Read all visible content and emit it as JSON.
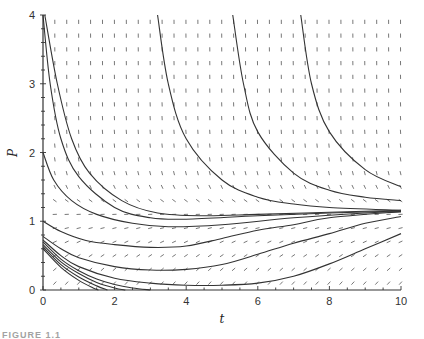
{
  "chart_data": {
    "type": "line",
    "subtype": "direction-field-with-solution-curves",
    "title": "",
    "xlabel": "t",
    "ylabel": "P",
    "xlim": [
      0,
      10
    ],
    "ylim": [
      0,
      4
    ],
    "x_ticks": [
      0,
      2,
      4,
      6,
      8,
      10
    ],
    "y_ticks": [
      0,
      1,
      2,
      3,
      4
    ],
    "x_tick_labels": [
      "0",
      "2",
      "4",
      "6",
      "8",
      "10"
    ],
    "y_tick_labels": [
      "0",
      "1",
      "2",
      "3",
      "4"
    ],
    "grid": false,
    "legend": null,
    "equilibrium_approx": 1.15,
    "slope_field": {
      "t_spacing": 0.333,
      "p_spacing": 0.2,
      "description": "short dash segments; steep negative slopes above P≈1.5, nearly flat near P≈1.15, positive small slopes below"
    },
    "series": [
      {
        "name": "curve-1",
        "points": [
          [
            0.0,
            4.0
          ],
          [
            0.2,
            3.0
          ],
          [
            0.5,
            2.2
          ],
          [
            1.0,
            1.65
          ],
          [
            2.0,
            1.2
          ],
          [
            3.0,
            1.05
          ],
          [
            4.0,
            1.03
          ],
          [
            6.0,
            1.08
          ],
          [
            8.0,
            1.12
          ],
          [
            10.0,
            1.15
          ]
        ]
      },
      {
        "name": "curve-2",
        "points": [
          [
            0.05,
            4.0
          ],
          [
            0.4,
            3.0
          ],
          [
            0.8,
            2.2
          ],
          [
            1.3,
            1.7
          ],
          [
            2.2,
            1.3
          ],
          [
            3.2,
            1.12
          ],
          [
            4.5,
            1.08
          ],
          [
            6.0,
            1.1
          ],
          [
            8.0,
            1.13
          ],
          [
            10.0,
            1.16
          ]
        ]
      },
      {
        "name": "curve-3",
        "points": [
          [
            0.0,
            2.0
          ],
          [
            0.3,
            1.6
          ],
          [
            0.8,
            1.3
          ],
          [
            1.5,
            1.1
          ],
          [
            2.5,
            0.97
          ],
          [
            3.5,
            0.92
          ],
          [
            5.0,
            0.95
          ],
          [
            7.0,
            1.05
          ],
          [
            9.0,
            1.12
          ],
          [
            10.0,
            1.14
          ]
        ]
      },
      {
        "name": "curve-4",
        "points": [
          [
            0.0,
            1.0
          ],
          [
            0.5,
            0.85
          ],
          [
            1.2,
            0.72
          ],
          [
            2.0,
            0.66
          ],
          [
            3.0,
            0.62
          ],
          [
            4.0,
            0.64
          ],
          [
            5.0,
            0.75
          ],
          [
            6.0,
            0.87
          ],
          [
            7.0,
            0.95
          ],
          [
            8.0,
            1.05
          ],
          [
            10.0,
            1.14
          ]
        ]
      },
      {
        "name": "curve-5",
        "points": [
          [
            0.0,
            0.78
          ],
          [
            0.5,
            0.6
          ],
          [
            1.0,
            0.47
          ],
          [
            2.0,
            0.34
          ],
          [
            3.0,
            0.29
          ],
          [
            4.0,
            0.3
          ],
          [
            5.0,
            0.37
          ],
          [
            6.0,
            0.52
          ],
          [
            7.0,
            0.68
          ],
          [
            8.0,
            0.82
          ],
          [
            9.0,
            0.97
          ],
          [
            10.0,
            1.07
          ]
        ]
      },
      {
        "name": "curve-6",
        "points": [
          [
            0.0,
            0.73
          ],
          [
            0.5,
            0.5
          ],
          [
            1.0,
            0.34
          ],
          [
            2.0,
            0.17
          ],
          [
            3.0,
            0.1
          ],
          [
            4.0,
            0.07
          ],
          [
            5.0,
            0.07
          ],
          [
            6.0,
            0.1
          ],
          [
            7.0,
            0.2
          ],
          [
            8.0,
            0.38
          ],
          [
            9.0,
            0.6
          ],
          [
            10.0,
            0.82
          ]
        ]
      },
      {
        "name": "curve-7",
        "points": [
          [
            0.0,
            0.7
          ],
          [
            0.5,
            0.45
          ],
          [
            1.0,
            0.28
          ],
          [
            1.5,
            0.16
          ],
          [
            2.0,
            0.08
          ],
          [
            2.5,
            0.03
          ],
          [
            3.0,
            0.0
          ]
        ]
      },
      {
        "name": "curve-8",
        "points": [
          [
            0.0,
            0.66
          ],
          [
            0.5,
            0.41
          ],
          [
            1.0,
            0.24
          ],
          [
            1.5,
            0.11
          ],
          [
            2.0,
            0.03
          ],
          [
            2.3,
            0.0
          ]
        ]
      },
      {
        "name": "curve-9",
        "points": [
          [
            0.0,
            0.63
          ],
          [
            0.5,
            0.37
          ],
          [
            1.0,
            0.19
          ],
          [
            1.5,
            0.06
          ],
          [
            1.8,
            0.0
          ]
        ]
      },
      {
        "name": "curve-10",
        "points": [
          [
            0.0,
            0.6
          ],
          [
            0.5,
            0.33
          ],
          [
            1.0,
            0.14
          ],
          [
            1.4,
            0.03
          ],
          [
            1.55,
            0.0
          ]
        ]
      },
      {
        "name": "curve-11",
        "points": [
          [
            3.2,
            4.0
          ],
          [
            3.5,
            3.0
          ],
          [
            4.0,
            2.2
          ],
          [
            5.0,
            1.6
          ],
          [
            6.0,
            1.35
          ],
          [
            7.0,
            1.25
          ],
          [
            8.0,
            1.2
          ],
          [
            10.0,
            1.16
          ]
        ]
      },
      {
        "name": "curve-12",
        "points": [
          [
            5.3,
            4.0
          ],
          [
            5.6,
            3.0
          ],
          [
            6.0,
            2.3
          ],
          [
            7.0,
            1.7
          ],
          [
            8.0,
            1.45
          ],
          [
            9.0,
            1.35
          ],
          [
            10.0,
            1.3
          ]
        ]
      },
      {
        "name": "curve-13",
        "points": [
          [
            7.2,
            4.0
          ],
          [
            7.5,
            3.0
          ],
          [
            8.0,
            2.3
          ],
          [
            9.0,
            1.75
          ],
          [
            10.0,
            1.5
          ]
        ]
      }
    ]
  },
  "caption": "FIGURE 1.1"
}
